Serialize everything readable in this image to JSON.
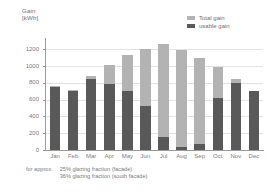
{
  "axis": {
    "y_title_line1": "Gain",
    "y_title_line2": "[kWh]",
    "y_ticks": [
      "0",
      "200",
      "400",
      "600",
      "800",
      "1000",
      "1200"
    ]
  },
  "legend": {
    "items": [
      {
        "label": "Total gain",
        "color": "#b3b3b3",
        "swatch_name": "legend-swatch-total-gain"
      },
      {
        "label": "usable gain",
        "color": "#595959",
        "swatch_name": "legend-swatch-usable-gain"
      }
    ]
  },
  "footnote": {
    "lead": "for approx.",
    "line1": "25% glazing fraction (facade)",
    "line2": "36% glazing fraction (south facade)"
  },
  "chart_data": {
    "type": "bar",
    "title": "",
    "xlabel": "",
    "ylabel": "Gain [kWh]",
    "ylim": [
      0,
      1300
    ],
    "grid": true,
    "legend_position": "top-right",
    "stacked": true,
    "categories": [
      "Jan",
      "Feb",
      "Mar",
      "Apr",
      "May",
      "Jun",
      "Jul",
      "Aug",
      "Sep",
      "Oct",
      "Nov",
      "Dec"
    ],
    "series": [
      {
        "name": "Total gain",
        "color": "#b3b3b3",
        "values": [
          760,
          710,
          880,
          1010,
          1130,
          1200,
          1270,
          1190,
          1100,
          995,
          845,
          705
        ]
      },
      {
        "name": "usable gain",
        "color": "#595959",
        "values": [
          755,
          705,
          845,
          790,
          700,
          520,
          150,
          40,
          75,
          620,
          800,
          700
        ]
      }
    ]
  }
}
